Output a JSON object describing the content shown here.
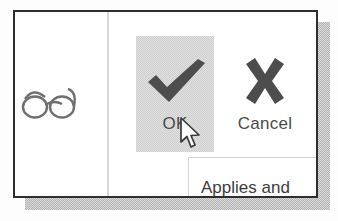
{
  "dialog": {
    "left_column": {
      "icon": "glasses-icon"
    },
    "buttons": [
      {
        "id": "ok",
        "label": "OK",
        "icon": "checkmark-icon",
        "state": "highlighted",
        "highlight_color": "#cfcfcf",
        "icon_color": "#4d4d4d"
      },
      {
        "id": "cancel",
        "label": "Cancel",
        "icon": "x-mark-icon",
        "state": "normal",
        "icon_color": "#4d4d4d"
      }
    ],
    "hint": {
      "text": "Applies and"
    },
    "cursor": {
      "type": "arrow-pointer",
      "x": 179,
      "y": 117
    },
    "colors": {
      "border": "#2e2e2e",
      "divider": "#d8d8d8",
      "shadow": "#b6b6b6",
      "text": "#4a4a4a",
      "background": "#ffffff"
    }
  }
}
